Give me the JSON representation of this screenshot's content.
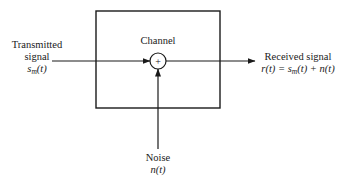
{
  "diagram": {
    "block": {
      "label": "Channel"
    },
    "summing_junction": {
      "symbol": "+"
    },
    "input": {
      "label_line1": "Transmitted",
      "label_line2": "signal",
      "math_base": "s",
      "math_sub": "m",
      "math_arg": "(t)"
    },
    "output": {
      "label": "Received signal",
      "equation_lhs": "r(t) = ",
      "equation_s": "s",
      "equation_sub": "m",
      "equation_rest": "(t) + n(t)"
    },
    "noise": {
      "label": "Noise",
      "math": "n(t)"
    },
    "colors": {
      "stroke": "#1a1a1a",
      "background": "#ffffff"
    }
  }
}
